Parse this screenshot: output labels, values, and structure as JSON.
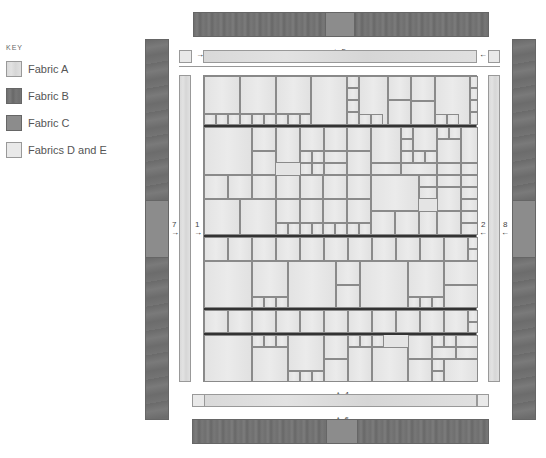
{
  "key": {
    "title": "KEY",
    "items": [
      {
        "label": "Fabric A",
        "fabric": "A",
        "color": "#dcdcdc"
      },
      {
        "label": "Fabric B",
        "fabric": "B",
        "color": "#727272"
      },
      {
        "label": "Fabric C",
        "fabric": "C",
        "color": "#8c8c8c"
      },
      {
        "label": "Fabrics D and E",
        "fabric": "DE",
        "color": "#e9e9e9"
      }
    ]
  },
  "labels": {
    "top_outer": "5",
    "top_inner": "3",
    "bottom_inner": "4",
    "bottom_outer": "6",
    "left_inner": "1",
    "right_inner": "2",
    "left_outer": "7",
    "right_outer": "8"
  },
  "arrows": {
    "down": "↓",
    "up": "↑",
    "right": "→",
    "left": "←"
  },
  "colors": {
    "fabric_a": "#dcdcdc",
    "fabric_b": "#727272",
    "fabric_c": "#8c8c8c",
    "fabric_de": "#e9e9e9",
    "seam": "#333333"
  },
  "center": {
    "seams_y": [
      49,
      159,
      232,
      257
    ],
    "cells": [
      [
        0,
        0,
        36,
        38
      ],
      [
        36,
        0,
        36,
        38
      ],
      [
        72,
        0,
        35,
        38
      ],
      [
        107,
        0,
        36,
        49
      ],
      [
        143,
        0,
        12,
        12
      ],
      [
        155,
        0,
        29,
        49
      ],
      [
        184,
        0,
        23,
        24
      ],
      [
        207,
        0,
        24,
        25
      ],
      [
        231,
        0,
        35,
        49
      ],
      [
        266,
        0,
        8,
        12
      ],
      [
        143,
        12,
        12,
        12
      ],
      [
        143,
        24,
        12,
        12
      ],
      [
        266,
        12,
        8,
        12
      ],
      [
        266,
        24,
        8,
        12
      ],
      [
        266,
        36,
        8,
        13
      ],
      [
        0,
        38,
        12,
        11
      ],
      [
        12,
        38,
        12,
        11
      ],
      [
        24,
        38,
        12,
        11
      ],
      [
        36,
        38,
        12,
        11
      ],
      [
        48,
        38,
        12,
        11
      ],
      [
        60,
        38,
        12,
        11
      ],
      [
        72,
        38,
        12,
        11
      ],
      [
        84,
        38,
        12,
        11
      ],
      [
        96,
        38,
        11,
        11
      ],
      [
        143,
        36,
        12,
        13
      ],
      [
        155,
        38,
        12,
        11
      ],
      [
        167,
        38,
        12,
        11
      ],
      [
        184,
        24,
        23,
        25
      ],
      [
        207,
        25,
        24,
        24
      ],
      [
        231,
        38,
        12,
        11
      ],
      [
        243,
        38,
        12,
        11
      ],
      [
        0,
        51,
        48,
        48
      ],
      [
        48,
        51,
        24,
        24
      ],
      [
        48,
        75,
        24,
        24
      ],
      [
        72,
        51,
        24,
        36
      ],
      [
        96,
        51,
        24,
        24
      ],
      [
        96,
        75,
        12,
        12
      ],
      [
        108,
        75,
        12,
        12
      ],
      [
        120,
        51,
        23,
        24
      ],
      [
        120,
        75,
        23,
        12
      ],
      [
        143,
        51,
        24,
        24
      ],
      [
        167,
        51,
        30,
        36
      ],
      [
        197,
        51,
        12,
        12
      ],
      [
        197,
        63,
        12,
        12
      ],
      [
        209,
        51,
        24,
        24
      ],
      [
        233,
        51,
        12,
        12
      ],
      [
        245,
        51,
        12,
        12
      ],
      [
        257,
        51,
        17,
        36
      ],
      [
        197,
        75,
        12,
        12
      ],
      [
        209,
        75,
        12,
        12
      ],
      [
        221,
        75,
        12,
        12
      ],
      [
        233,
        63,
        24,
        24
      ],
      [
        96,
        87,
        12,
        12
      ],
      [
        108,
        87,
        12,
        12
      ],
      [
        120,
        87,
        23,
        12
      ],
      [
        143,
        75,
        24,
        24
      ],
      [
        167,
        87,
        30,
        12
      ],
      [
        197,
        87,
        36,
        12
      ],
      [
        233,
        87,
        24,
        12
      ],
      [
        257,
        87,
        17,
        12
      ],
      [
        0,
        99,
        24,
        24
      ],
      [
        24,
        99,
        24,
        24
      ],
      [
        48,
        99,
        24,
        24
      ],
      [
        72,
        99,
        24,
        24
      ],
      [
        96,
        99,
        23,
        24
      ],
      [
        119,
        99,
        24,
        24
      ],
      [
        143,
        99,
        24,
        24
      ],
      [
        167,
        99,
        48,
        36
      ],
      [
        215,
        99,
        18,
        12
      ],
      [
        233,
        99,
        24,
        12
      ],
      [
        257,
        99,
        17,
        12
      ],
      [
        215,
        111,
        18,
        12
      ],
      [
        233,
        111,
        24,
        24
      ],
      [
        257,
        111,
        17,
        12
      ],
      [
        0,
        123,
        36,
        36
      ],
      [
        36,
        123,
        36,
        36
      ],
      [
        72,
        123,
        24,
        24
      ],
      [
        96,
        123,
        23,
        24
      ],
      [
        119,
        123,
        24,
        24
      ],
      [
        143,
        123,
        24,
        24
      ],
      [
        257,
        123,
        17,
        12
      ],
      [
        72,
        147,
        12,
        12
      ],
      [
        84,
        147,
        12,
        12
      ],
      [
        96,
        147,
        12,
        12
      ],
      [
        108,
        147,
        11,
        12
      ],
      [
        119,
        147,
        12,
        12
      ],
      [
        131,
        147,
        12,
        12
      ],
      [
        143,
        147,
        12,
        12
      ],
      [
        155,
        147,
        12,
        12
      ],
      [
        167,
        135,
        24,
        24
      ],
      [
        191,
        135,
        24,
        24
      ],
      [
        215,
        135,
        18,
        24
      ],
      [
        233,
        135,
        24,
        24
      ],
      [
        257,
        135,
        17,
        12
      ],
      [
        257,
        147,
        17,
        12
      ],
      [
        0,
        161,
        24,
        24
      ],
      [
        24,
        161,
        24,
        24
      ],
      [
        48,
        161,
        24,
        24
      ],
      [
        72,
        161,
        24,
        24
      ],
      [
        96,
        161,
        24,
        24
      ],
      [
        120,
        161,
        24,
        24
      ],
      [
        144,
        161,
        24,
        24
      ],
      [
        168,
        161,
        24,
        24
      ],
      [
        192,
        161,
        24,
        24
      ],
      [
        216,
        161,
        24,
        24
      ],
      [
        240,
        161,
        24,
        24
      ],
      [
        264,
        161,
        10,
        12
      ],
      [
        264,
        173,
        10,
        12
      ],
      [
        0,
        185,
        48,
        47
      ],
      [
        48,
        185,
        36,
        36
      ],
      [
        84,
        185,
        48,
        47
      ],
      [
        132,
        185,
        24,
        24
      ],
      [
        132,
        209,
        24,
        23
      ],
      [
        156,
        185,
        48,
        47
      ],
      [
        204,
        185,
        36,
        36
      ],
      [
        240,
        185,
        34,
        24
      ],
      [
        240,
        209,
        34,
        23
      ],
      [
        48,
        221,
        12,
        11
      ],
      [
        60,
        221,
        12,
        11
      ],
      [
        72,
        221,
        12,
        11
      ],
      [
        204,
        221,
        12,
        11
      ],
      [
        216,
        221,
        12,
        11
      ],
      [
        228,
        221,
        12,
        11
      ],
      [
        0,
        234,
        24,
        23
      ],
      [
        24,
        234,
        24,
        23
      ],
      [
        48,
        234,
        24,
        23
      ],
      [
        72,
        234,
        24,
        23
      ],
      [
        96,
        234,
        24,
        23
      ],
      [
        120,
        234,
        24,
        23
      ],
      [
        144,
        234,
        24,
        23
      ],
      [
        168,
        234,
        24,
        23
      ],
      [
        192,
        234,
        24,
        23
      ],
      [
        216,
        234,
        24,
        23
      ],
      [
        240,
        234,
        24,
        23
      ],
      [
        264,
        234,
        10,
        12
      ],
      [
        264,
        246,
        10,
        11
      ],
      [
        0,
        259,
        48,
        47
      ],
      [
        48,
        259,
        12,
        12
      ],
      [
        60,
        259,
        12,
        12
      ],
      [
        72,
        259,
        12,
        12
      ],
      [
        48,
        271,
        36,
        35
      ],
      [
        84,
        259,
        36,
        36
      ],
      [
        84,
        295,
        12,
        11
      ],
      [
        96,
        295,
        12,
        11
      ],
      [
        108,
        295,
        12,
        11
      ],
      [
        120,
        259,
        24,
        24
      ],
      [
        120,
        283,
        24,
        23
      ],
      [
        144,
        259,
        12,
        12
      ],
      [
        156,
        259,
        12,
        12
      ],
      [
        168,
        259,
        12,
        12
      ],
      [
        144,
        271,
        24,
        35
      ],
      [
        168,
        271,
        36,
        35
      ],
      [
        204,
        259,
        24,
        24
      ],
      [
        204,
        283,
        24,
        23
      ],
      [
        228,
        259,
        12,
        12
      ],
      [
        240,
        259,
        12,
        12
      ],
      [
        252,
        259,
        22,
        12
      ],
      [
        228,
        271,
        24,
        12
      ],
      [
        228,
        283,
        12,
        12
      ],
      [
        228,
        295,
        12,
        11
      ],
      [
        240,
        283,
        34,
        23
      ],
      [
        252,
        271,
        22,
        12
      ]
    ]
  }
}
